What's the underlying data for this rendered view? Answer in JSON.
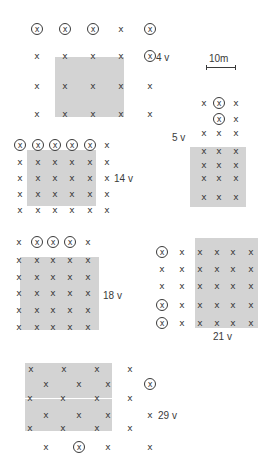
{
  "scale_bar": {
    "label": "10m",
    "x1": 206,
    "x2": 235,
    "y": 67,
    "label_x": 209,
    "label_y": 58
  },
  "plots": [
    {
      "id": "plot-4v",
      "label": "4 v",
      "label_pos": [
        156,
        57
      ],
      "shade": {
        "x": 55,
        "y": 57,
        "w": 69,
        "h": 60
      },
      "points": [
        [
          37,
          29,
          1
        ],
        [
          65,
          29,
          1
        ],
        [
          93,
          29,
          1
        ],
        [
          121,
          29,
          0
        ],
        [
          150,
          29,
          1
        ],
        [
          37,
          56,
          0
        ],
        [
          65,
          56,
          0
        ],
        [
          93,
          56,
          0
        ],
        [
          121,
          56,
          0
        ],
        [
          150,
          56,
          1
        ],
        [
          37,
          86,
          0
        ],
        [
          65,
          86,
          0
        ],
        [
          93,
          86,
          0
        ],
        [
          121,
          86,
          0
        ],
        [
          150,
          86,
          0
        ],
        [
          37,
          114,
          0
        ],
        [
          65,
          114,
          0
        ],
        [
          93,
          114,
          0
        ],
        [
          121,
          114,
          0
        ],
        [
          150,
          114,
          0
        ]
      ]
    },
    {
      "id": "plot-5v",
      "label": "5 v",
      "label_pos": [
        172,
        137
      ],
      "shade": {
        "x": 190,
        "y": 147,
        "w": 56,
        "h": 60
      },
      "points": [
        [
          204,
          103,
          0
        ],
        [
          219,
          103,
          1
        ],
        [
          236,
          103,
          0
        ],
        [
          219,
          119,
          1
        ],
        [
          236,
          119,
          0
        ],
        [
          204,
          133,
          0
        ],
        [
          219,
          133,
          0
        ],
        [
          236,
          133,
          0
        ],
        [
          204,
          151,
          0
        ],
        [
          219,
          151,
          0
        ],
        [
          236,
          151,
          0
        ],
        [
          204,
          165,
          0
        ],
        [
          219,
          165,
          0
        ],
        [
          236,
          165,
          0
        ],
        [
          204,
          178,
          0
        ],
        [
          219,
          178,
          0
        ],
        [
          236,
          178,
          0
        ],
        [
          204,
          197,
          0
        ],
        [
          219,
          197,
          0
        ],
        [
          236,
          197,
          0
        ]
      ]
    },
    {
      "id": "plot-14v",
      "label": "14 v",
      "label_pos": [
        114,
        178
      ],
      "shade": {
        "x": 27,
        "y": 150,
        "w": 69,
        "h": 56
      },
      "points": [
        [
          20,
          145,
          1
        ],
        [
          38,
          145,
          1
        ],
        [
          55,
          145,
          1
        ],
        [
          72,
          145,
          1
        ],
        [
          90,
          145,
          1
        ],
        [
          107,
          145,
          0
        ],
        [
          20,
          162,
          0
        ],
        [
          38,
          162,
          0
        ],
        [
          55,
          162,
          0
        ],
        [
          72,
          162,
          0
        ],
        [
          90,
          162,
          0
        ],
        [
          107,
          162,
          0
        ],
        [
          20,
          178,
          0
        ],
        [
          38,
          178,
          0
        ],
        [
          55,
          178,
          0
        ],
        [
          72,
          178,
          0
        ],
        [
          90,
          178,
          0
        ],
        [
          107,
          178,
          0
        ],
        [
          20,
          194,
          0
        ],
        [
          38,
          194,
          0
        ],
        [
          55,
          194,
          0
        ],
        [
          72,
          194,
          0
        ],
        [
          90,
          194,
          0
        ],
        [
          107,
          194,
          0
        ],
        [
          20,
          210,
          0
        ],
        [
          38,
          210,
          0
        ],
        [
          55,
          210,
          0
        ],
        [
          72,
          210,
          0
        ],
        [
          90,
          210,
          0
        ],
        [
          107,
          210,
          0
        ]
      ]
    },
    {
      "id": "plot-18v",
      "label": "18 v",
      "label_pos": [
        103,
        295
      ],
      "shade": {
        "x": 20,
        "y": 257,
        "w": 79,
        "h": 73
      },
      "points": [
        [
          19,
          242,
          0
        ],
        [
          37,
          242,
          1
        ],
        [
          53,
          242,
          1
        ],
        [
          70,
          242,
          1
        ],
        [
          88,
          242,
          0
        ],
        [
          19,
          260,
          0
        ],
        [
          37,
          260,
          0
        ],
        [
          53,
          260,
          0
        ],
        [
          70,
          260,
          0
        ],
        [
          88,
          260,
          0
        ],
        [
          19,
          277,
          0
        ],
        [
          37,
          277,
          0
        ],
        [
          53,
          277,
          0
        ],
        [
          70,
          277,
          0
        ],
        [
          88,
          277,
          0
        ],
        [
          19,
          293,
          0
        ],
        [
          37,
          293,
          0
        ],
        [
          53,
          293,
          0
        ],
        [
          70,
          293,
          0
        ],
        [
          88,
          293,
          0
        ],
        [
          19,
          310,
          0
        ],
        [
          37,
          310,
          0
        ],
        [
          53,
          310,
          0
        ],
        [
          70,
          310,
          0
        ],
        [
          88,
          310,
          0
        ],
        [
          19,
          327,
          0
        ],
        [
          37,
          327,
          0
        ],
        [
          53,
          327,
          0
        ],
        [
          70,
          327,
          0
        ],
        [
          88,
          327,
          0
        ]
      ]
    },
    {
      "id": "plot-21v",
      "label": "21 v",
      "label_pos": [
        213,
        336
      ],
      "shade": {
        "x": 195,
        "y": 238,
        "w": 63,
        "h": 90
      },
      "points": [
        [
          162,
          252,
          1
        ],
        [
          182,
          252,
          0
        ],
        [
          200,
          252,
          0
        ],
        [
          217,
          252,
          0
        ],
        [
          233,
          252,
          0
        ],
        [
          251,
          252,
          0
        ],
        [
          162,
          269,
          0
        ],
        [
          182,
          269,
          0
        ],
        [
          200,
          269,
          0
        ],
        [
          217,
          269,
          0
        ],
        [
          233,
          269,
          0
        ],
        [
          251,
          269,
          0
        ],
        [
          162,
          286,
          0
        ],
        [
          182,
          286,
          0
        ],
        [
          200,
          286,
          0
        ],
        [
          217,
          286,
          0
        ],
        [
          233,
          286,
          0
        ],
        [
          251,
          286,
          0
        ],
        [
          162,
          305,
          1
        ],
        [
          182,
          305,
          0
        ],
        [
          200,
          305,
          0
        ],
        [
          217,
          305,
          0
        ],
        [
          233,
          305,
          0
        ],
        [
          251,
          305,
          0
        ],
        [
          162,
          323,
          1
        ],
        [
          182,
          323,
          0
        ],
        [
          200,
          323,
          0
        ],
        [
          217,
          323,
          0
        ],
        [
          233,
          323,
          0
        ],
        [
          251,
          323,
          0
        ]
      ]
    },
    {
      "id": "plot-29v",
      "label": "29 v",
      "label_pos": [
        158,
        415
      ],
      "shade": {
        "x": 25,
        "y": 363,
        "w": 87,
        "h": 68
      },
      "white_line": {
        "x": 25,
        "y": 398,
        "w": 87
      },
      "points": [
        [
          31,
          369,
          0
        ],
        [
          64,
          369,
          0
        ],
        [
          97,
          369,
          0
        ],
        [
          130,
          369,
          0
        ],
        [
          46,
          384,
          0
        ],
        [
          79,
          384,
          0
        ],
        [
          108,
          384,
          0
        ],
        [
          150,
          384,
          1
        ],
        [
          30,
          398,
          0
        ],
        [
          63,
          398,
          0
        ],
        [
          97,
          398,
          0
        ],
        [
          130,
          398,
          0
        ],
        [
          46,
          415,
          0
        ],
        [
          79,
          415,
          0
        ],
        [
          108,
          415,
          0
        ],
        [
          150,
          415,
          0
        ],
        [
          30,
          428,
          0
        ],
        [
          63,
          428,
          0
        ],
        [
          97,
          428,
          0
        ],
        [
          130,
          428,
          0
        ],
        [
          46,
          447,
          0
        ],
        [
          79,
          447,
          1
        ],
        [
          108,
          447,
          0
        ],
        [
          150,
          447,
          0
        ]
      ]
    }
  ],
  "symbols": {
    "plain": "x",
    "circled": "x"
  },
  "colors": {
    "shade": "#d3d3d3",
    "ink": "#3a3a3a",
    "background": "#ffffff"
  }
}
